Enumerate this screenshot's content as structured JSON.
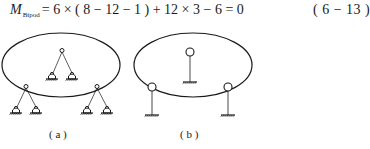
{
  "equation": {
    "lhs_var": "M",
    "lhs_sub": "Bipod",
    "rhs": "= 6 × ( 8 − 12 − 1 ) + 12 × 3 − 6 = 0",
    "number": "( 6 − 13 )"
  },
  "figures": [
    {
      "id": "a",
      "caption": "( a )",
      "description": "Ellipse enclosing one bipod; two further bipods straddle the boundary. Each bipod is a top hinge joined by two bars to two pinned supports.",
      "bipods": 3,
      "supports_per_bipod": 2,
      "support_type": "pinned"
    },
    {
      "id": "b",
      "caption": "( b )",
      "description": "Ellipse with three hinged nodes, each on a vertical bar to a fixed ground.",
      "nodes": 3,
      "support_type": "fixed-ground"
    }
  ],
  "colors": {
    "ink": "#1a1a1a",
    "background": "#ffffff"
  }
}
